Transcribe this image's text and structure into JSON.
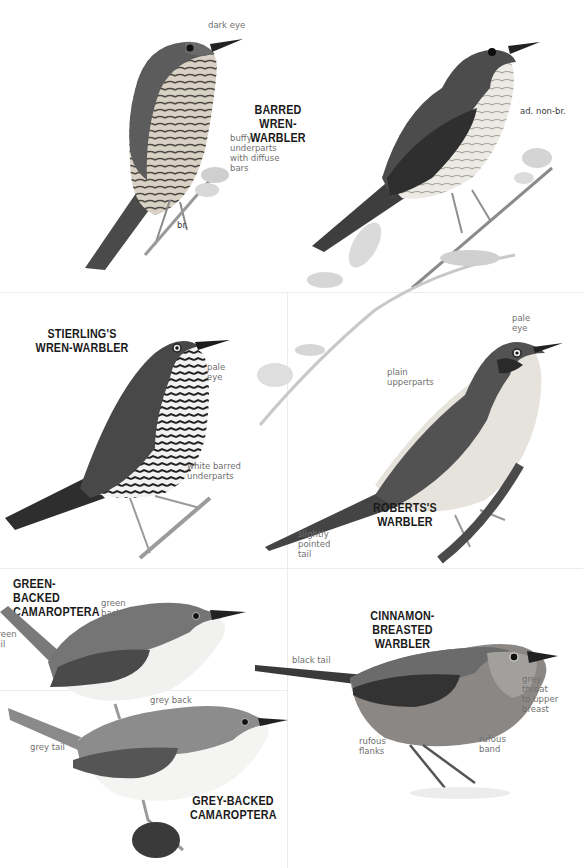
{
  "plate": {
    "species": [
      {
        "id": "barred-wren-warbler",
        "title": "BARRED\nWREN-WARBLER",
        "plumages": [
          {
            "tag": "br.",
            "labels": [
              "dark eye",
              "buffy\nunderparts\nwith diffuse\nbars"
            ]
          },
          {
            "tag": "ad. non-br.",
            "labels": []
          }
        ]
      },
      {
        "id": "stierlings-wren-warbler",
        "title": "STIERLING'S\nWREN-WARBLER",
        "labels": [
          "pale\neye",
          "white barred\nunderparts"
        ]
      },
      {
        "id": "robertss-warbler",
        "title": "ROBERTS'S\nWARBLER",
        "labels": [
          "pale\neye",
          "plain\nupperparts",
          "slightly\npointed\ntail"
        ]
      },
      {
        "id": "green-backed-camaroptera",
        "title": "GREEN-BACKED\nCAMAROPTERA",
        "labels": [
          "green\nback",
          "green\ntail"
        ]
      },
      {
        "id": "grey-backed-camaroptera",
        "title": "GREY-BACKED\nCAMAROPTERA",
        "labels": [
          "grey back",
          "grey tail"
        ]
      },
      {
        "id": "cinnamon-breasted-warbler",
        "title": "CINNAMON-BREASTED\nWARBLER",
        "labels": [
          "black tail",
          "grey\nthroat\nto upper\nbreast",
          "rufous\nflanks",
          "rufous\nband"
        ]
      }
    ]
  }
}
